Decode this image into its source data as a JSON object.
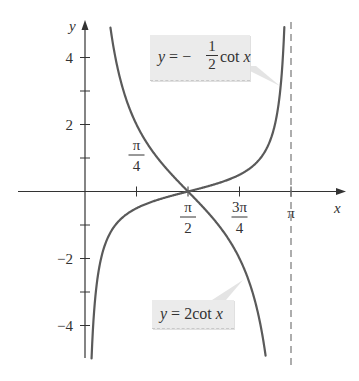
{
  "chart_data": {
    "type": "line",
    "title": "",
    "xlabel": "x",
    "ylabel": "y",
    "xlim": [
      -0.5,
      4.0
    ],
    "ylim": [
      -5,
      5
    ],
    "x_ticks": [
      {
        "value": 0.7854,
        "label_num": "π",
        "label_den": "4",
        "position": "above"
      },
      {
        "value": 1.5708,
        "label_num": "π",
        "label_den": "2",
        "position": "below"
      },
      {
        "value": 2.3562,
        "label_num": "3π",
        "label_den": "4",
        "position": "below"
      },
      {
        "value": 3.1416,
        "label": "π",
        "position": "below"
      }
    ],
    "y_ticks": [
      {
        "value": 4,
        "label": "4"
      },
      {
        "value": 3,
        "label": ""
      },
      {
        "value": 2,
        "label": "2"
      },
      {
        "value": 1,
        "label": ""
      },
      {
        "value": -1,
        "label": ""
      },
      {
        "value": -2,
        "label": "−2"
      },
      {
        "value": -3,
        "label": ""
      },
      {
        "value": -4,
        "label": "−4"
      }
    ],
    "grid": false,
    "asymptote": {
      "x": 3.1416,
      "style": "dashed"
    },
    "series": [
      {
        "name": "y = 2cot x",
        "function": "2*cot(x)",
        "domain": [
          0.38,
          2.77
        ],
        "color": "#5a5a5a"
      },
      {
        "name": "y = −(1/2) cot x",
        "function": "-0.5*cot(x)",
        "domain": [
          0.1,
          3.04
        ],
        "color": "#5a5a5a"
      }
    ],
    "annotations": [
      {
        "text": "y = −(1/2) cot x",
        "points_to": "upper right branch near x≈3"
      },
      {
        "text": "y = 2cot x",
        "points_to": "lower right branch near x≈2.2"
      }
    ]
  },
  "labels": {
    "x_axis": "x",
    "y_axis": "y",
    "callout_top": {
      "prefix": "y",
      "eq": " = − ",
      "num": "1",
      "den": "2",
      "suffix": " cot ",
      "var": "x"
    },
    "callout_bottom": {
      "prefix": "y",
      "eq": " = 2cot ",
      "var": "x"
    }
  },
  "colors": {
    "curve": "#5a5a5a",
    "axis": "#333333",
    "callout_bg": "#ebebeb"
  }
}
